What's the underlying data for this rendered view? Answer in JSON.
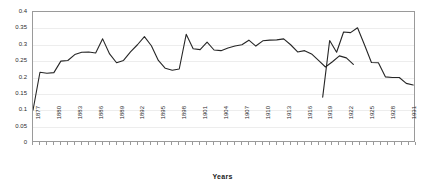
{
  "chart_data": {
    "type": "line",
    "title": "",
    "xlabel": "Years",
    "ylabel": "",
    "ylim": [
      0,
      0.4
    ],
    "ytick_labels": [
      "0.4",
      "0.35",
      "0.3",
      "0.25",
      "0.2",
      "0.15",
      "0.1",
      "0.05",
      "0"
    ],
    "ytick_values": [
      0.4,
      0.35,
      0.3,
      0.25,
      0.2,
      0.15,
      0.1,
      0.05,
      0
    ],
    "xlim": [
      1877,
      1932
    ],
    "xtick_labels": [
      "1877",
      "1880",
      "1883",
      "1886",
      "1889",
      "1892",
      "1895",
      "1898",
      "1901",
      "1904",
      "1907",
      "1910",
      "1913",
      "1916",
      "1919",
      "1922",
      "1925",
      "1928",
      "1931"
    ],
    "xtick_values": [
      1877,
      1880,
      1883,
      1886,
      1889,
      1892,
      1895,
      1898,
      1901,
      1904,
      1907,
      1910,
      1913,
      1916,
      1919,
      1922,
      1925,
      1928,
      1931
    ],
    "grid": "horizontal",
    "legend": "none",
    "series": [
      {
        "name": "series-1",
        "color": "#262626",
        "x": [
          1877,
          1878,
          1879,
          1880,
          1881,
          1882,
          1883,
          1884,
          1885,
          1886,
          1887,
          1888,
          1889,
          1890,
          1891,
          1892,
          1893,
          1894,
          1895,
          1896,
          1897,
          1898,
          1899,
          1900,
          1901,
          1902,
          1903,
          1904,
          1905,
          1906,
          1907,
          1908,
          1909,
          1910,
          1911,
          1912,
          1913,
          1914,
          1919,
          1920,
          1921,
          1922,
          1923,
          1924,
          1925,
          1926,
          1927,
          1928,
          1929,
          1930,
          1931,
          1932
        ],
        "values": [
          0.1,
          0.216,
          0.213,
          0.215,
          0.25,
          0.252,
          0.27,
          0.277,
          0.278,
          0.275,
          0.318,
          0.272,
          0.245,
          0.252,
          0.278,
          0.3,
          0.325,
          0.297,
          0.252,
          0.228,
          0.222,
          0.226,
          0.332,
          0.288,
          0.285,
          0.308,
          0.284,
          0.282,
          0.29,
          0.296,
          0.3,
          0.314,
          0.296,
          0.312,
          0.314,
          0.315,
          0.318,
          0.3,
          0.278,
          0.282,
          0.272,
          0.252,
          0.232,
          0.248,
          0.266,
          0.26,
          0.24,
          0.14,
          0.313,
          0.277,
          0.339,
          0.337
        ]
      }
    ],
    "segments": [
      {
        "name": "pre-war-segment",
        "points": [
          {
            "year": 1877,
            "value": 0.1
          },
          {
            "year": 1878,
            "value": 0.216
          },
          {
            "year": 1879,
            "value": 0.213
          },
          {
            "year": 1880,
            "value": 0.215
          },
          {
            "year": 1881,
            "value": 0.25
          },
          {
            "year": 1882,
            "value": 0.252
          },
          {
            "year": 1883,
            "value": 0.27
          },
          {
            "year": 1884,
            "value": 0.277
          },
          {
            "year": 1885,
            "value": 0.278
          },
          {
            "year": 1886,
            "value": 0.275
          },
          {
            "year": 1887,
            "value": 0.318
          },
          {
            "year": 1888,
            "value": 0.272
          },
          {
            "year": 1889,
            "value": 0.245
          },
          {
            "year": 1890,
            "value": 0.252
          },
          {
            "year": 1891,
            "value": 0.278
          },
          {
            "year": 1892,
            "value": 0.3
          },
          {
            "year": 1893,
            "value": 0.325
          },
          {
            "year": 1894,
            "value": 0.297
          },
          {
            "year": 1895,
            "value": 0.252
          },
          {
            "year": 1896,
            "value": 0.228
          },
          {
            "year": 1897,
            "value": 0.222
          },
          {
            "year": 1898,
            "value": 0.226
          },
          {
            "year": 1899,
            "value": 0.332
          },
          {
            "year": 1900,
            "value": 0.288
          },
          {
            "year": 1901,
            "value": 0.285
          },
          {
            "year": 1902,
            "value": 0.308
          },
          {
            "year": 1903,
            "value": 0.284
          },
          {
            "year": 1904,
            "value": 0.282
          },
          {
            "year": 1905,
            "value": 0.29
          },
          {
            "year": 1906,
            "value": 0.296
          },
          {
            "year": 1907,
            "value": 0.3
          },
          {
            "year": 1908,
            "value": 0.314
          },
          {
            "year": 1909,
            "value": 0.296
          },
          {
            "year": 1910,
            "value": 0.312
          },
          {
            "year": 1911,
            "value": 0.314
          },
          {
            "year": 1912,
            "value": 0.315
          },
          {
            "year": 1913,
            "value": 0.318
          },
          {
            "year": 1914,
            "value": 0.3
          },
          {
            "year": 1915,
            "value": 0.278
          },
          {
            "year": 1916,
            "value": 0.282
          },
          {
            "year": 1917,
            "value": 0.272
          },
          {
            "year": 1918,
            "value": 0.252
          },
          {
            "year": 1919,
            "value": 0.232
          },
          {
            "year": 1920,
            "value": 0.248
          },
          {
            "year": 1921,
            "value": 0.266
          },
          {
            "year": 1922,
            "value": 0.26
          },
          {
            "year": 1923,
            "value": 0.24
          }
        ]
      },
      {
        "name": "post-war-segment",
        "points": [
          {
            "year": 1927,
            "value": 0.14
          },
          {
            "year": 1928,
            "value": 0.313
          },
          {
            "year": 1929,
            "value": 0.277
          },
          {
            "year": 1930,
            "value": 0.339
          },
          {
            "year": 1931,
            "value": 0.337
          },
          {
            "year": 1932,
            "value": 0.352
          },
          {
            "year": 1933,
            "value": 0.3
          },
          {
            "year": 1934,
            "value": 0.246
          },
          {
            "year": 1935,
            "value": 0.245
          },
          {
            "year": 1936,
            "value": 0.202
          },
          {
            "year": 1937,
            "value": 0.2
          },
          {
            "year": 1938,
            "value": 0.2
          },
          {
            "year": 1939,
            "value": 0.182
          },
          {
            "year": 1940,
            "value": 0.177
          }
        ]
      }
    ],
    "notes": {
      "gap": "data gap between the two plotted segments",
      "minimum": 0.1,
      "maximum": 0.352
    }
  },
  "title_remnant": ""
}
